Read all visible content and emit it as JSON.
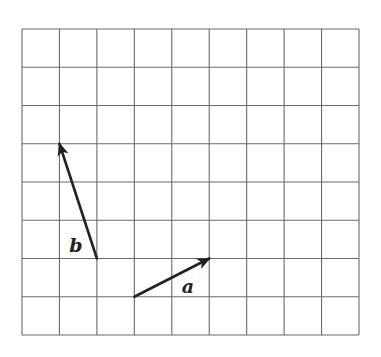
{
  "diagram": {
    "type": "vector-grid",
    "grid": {
      "columns": 9,
      "rows": 8,
      "left": 22,
      "top": 29,
      "right": 359,
      "bottom": 335,
      "line_color": "#6b6b6b"
    },
    "vectors": [
      {
        "name": "a",
        "label": "a",
        "start_cell": [
          3,
          7
        ],
        "end_cell": [
          5,
          6
        ],
        "components": [
          2,
          1
        ],
        "label_pos": [
          188,
          293
        ],
        "color": "#222222"
      },
      {
        "name": "b",
        "label": "b",
        "start_cell": [
          2,
          6
        ],
        "end_cell": [
          1,
          3
        ],
        "components": [
          -1,
          3
        ],
        "label_pos": [
          76,
          252
        ],
        "color": "#222222"
      }
    ]
  }
}
